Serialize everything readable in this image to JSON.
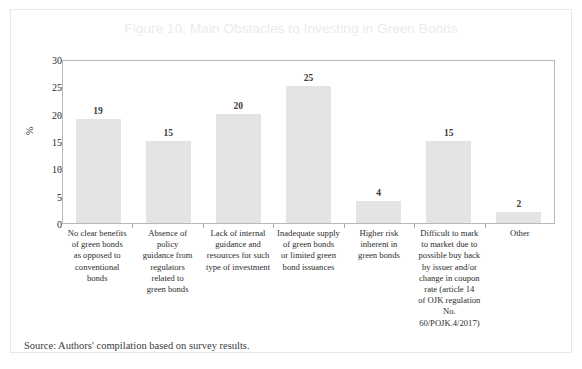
{
  "figure": {
    "title": "Figure 10: Main Obstacles to Investing in Green Bonds",
    "source_note": "Source: Authors' compilation based on survey results.",
    "title_color": "#ebebeb",
    "bar_color": "#e4e4e4",
    "axis_color": "#b9b9b9",
    "text_color": "#2c2c2c"
  },
  "chart_data": {
    "type": "bar",
    "title": "Figure 10: Main Obstacles to Investing in Green Bonds",
    "xlabel": "",
    "ylabel": "%",
    "ylim": [
      0,
      30
    ],
    "yticks": [
      0,
      5,
      10,
      15,
      20,
      25,
      30
    ],
    "grid": false,
    "legend": "none",
    "categories": [
      "No clear benefits of green bonds as opposed to conventional bonds",
      "Absence of policy guidance from regulators related to green bonds",
      "Lack of internal guidance and resources for such type of investment",
      "Inadequate supply of green bonds or limited green bond issuances",
      "Higher risk inherent in green bonds",
      "Difficult to mark to market due to possible buy back by issuer and/or change in coupon rate (article 14 of OJK regulation No. 60/POJK.4/2017)",
      "Other"
    ],
    "category_lines": [
      [
        "No clear benefits",
        "of green bonds",
        "as opposed to",
        "conventional",
        "bonds"
      ],
      [
        "Absence of",
        "policy",
        "guidance from",
        "regulators",
        "related to",
        "green bonds"
      ],
      [
        "Lack of internal",
        "guidance and",
        "resources for such",
        "type of investment"
      ],
      [
        "Inadequate supply",
        "of green bonds",
        "or limited green",
        "bond issuances"
      ],
      [
        "Higher risk",
        "inherent in",
        "green bonds"
      ],
      [
        "Difficult to mark",
        "to market due to",
        "possible buy back",
        "by issuer and/or",
        "change in coupon",
        "rate (article 14",
        "of OJK regulation",
        "No. 60/POJK.4/2017)"
      ],
      [
        "Other"
      ]
    ],
    "values": [
      19,
      15,
      20,
      25,
      4,
      15,
      2
    ],
    "value_labels": [
      "19",
      "15",
      "20",
      "25",
      "4",
      "15",
      "2"
    ]
  }
}
